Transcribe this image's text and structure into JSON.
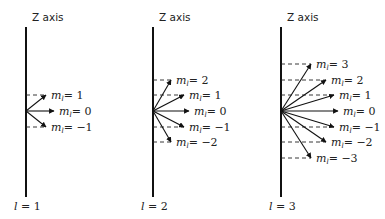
{
  "figure": {
    "axis_label": "Z axis",
    "diagrams": [
      {
        "l_label": "l = 1",
        "l": 1,
        "axis_x": 26,
        "origin_y": 111,
        "vectors": [
          {
            "ml": "1",
            "label": "m_l = 1",
            "tip": [
              46,
              95
            ],
            "dash_y": 95
          },
          {
            "ml": "0",
            "label": "m_l = 0",
            "tip": [
              54,
              111
            ],
            "dash_y": null
          },
          {
            "ml": "-1",
            "label": "m_l = -1",
            "tip": [
              46,
              127
            ],
            "dash_y": 127
          }
        ]
      },
      {
        "l_label": "l = 2",
        "l": 2,
        "axis_x": 153,
        "origin_y": 111,
        "vectors": [
          {
            "ml": "2",
            "label": "m_l = 2",
            "tip": [
              171,
              80
            ],
            "dash_y": 80
          },
          {
            "ml": "1",
            "label": "m_l = 1",
            "tip": [
              184,
              95
            ],
            "dash_y": 95
          },
          {
            "ml": "0",
            "label": "m_l = 0",
            "tip": [
              189,
              111
            ],
            "dash_y": null
          },
          {
            "ml": "-1",
            "label": "m_l = -1",
            "tip": [
              184,
              127
            ],
            "dash_y": 127
          },
          {
            "ml": "-2",
            "label": "m_l = -2",
            "tip": [
              171,
              142
            ],
            "dash_y": 142
          }
        ]
      },
      {
        "l_label": "l = 3",
        "l": 3,
        "axis_x": 281,
        "origin_y": 111,
        "vectors": [
          {
            "ml": "3",
            "label": "m_l = 3",
            "tip": [
              311,
              64
            ],
            "dash_y": 64
          },
          {
            "ml": "2",
            "label": "m_l = 2",
            "tip": [
              326,
              80
            ],
            "dash_y": 80
          },
          {
            "ml": "1",
            "label": "m_l = 1",
            "tip": [
              334,
              95
            ],
            "dash_y": 95
          },
          {
            "ml": "0",
            "label": "m_l = 0",
            "tip": [
              338,
              111
            ],
            "dash_y": null
          },
          {
            "ml": "-1",
            "label": "m_l = -1",
            "tip": [
              334,
              127
            ],
            "dash_y": 127
          },
          {
            "ml": "-2",
            "label": "m_l = -2",
            "tip": [
              326,
              142
            ],
            "dash_y": 142
          },
          {
            "ml": "-3",
            "label": "m_l = -3",
            "tip": [
              311,
              158
            ],
            "dash_y": 158
          }
        ]
      }
    ]
  }
}
